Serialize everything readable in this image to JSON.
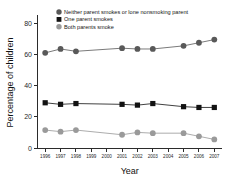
{
  "chart_data": {
    "type": "line",
    "title": "",
    "xlabel": "Year",
    "ylabel": "Percentage of children",
    "categories": [
      "1996",
      "1997",
      "1998",
      "1999",
      "2000",
      "2001",
      "2002",
      "2003",
      "2004",
      "2005",
      "2006",
      "2007"
    ],
    "x": [
      1996,
      1997,
      1998,
      1999,
      2000,
      2001,
      2002,
      2003,
      2004,
      2005,
      2006,
      2007
    ],
    "xlim": [
      1995.5,
      2007.5
    ],
    "ylim": [
      0,
      84
    ],
    "yticks": [
      0,
      20,
      40,
      60,
      80
    ],
    "ytick_labels": [
      "0",
      "20",
      "40",
      "60",
      "80"
    ],
    "xticks": [
      1996,
      1997,
      1998,
      1999,
      2000,
      2001,
      2002,
      2003,
      2004,
      2005,
      2006,
      2007
    ],
    "xtick_labels": [
      "1996",
      "1997",
      "1998",
      "1999",
      "2000",
      "2001",
      "2002",
      "2003",
      "2004",
      "2005",
      "2006",
      "2007"
    ],
    "grid": false,
    "legend_position": "top-center",
    "series": [
      {
        "name": "Neither parent smokes or lone nonsmoking parent",
        "marker": "circle",
        "color": "#595959",
        "line_color": "#6b6b6b",
        "values": [
          61,
          63.5,
          62,
          null,
          null,
          64,
          63.5,
          63.5,
          null,
          65.5,
          67.5,
          69.5
        ]
      },
      {
        "name": "One parent smokes",
        "marker": "square",
        "color": "#121212",
        "line_color": "#2b2b2b",
        "values": [
          29,
          28,
          28.5,
          null,
          null,
          28,
          27.5,
          28.5,
          null,
          26.5,
          26,
          26
        ]
      },
      {
        "name": "Both parents smoke",
        "marker": "circle",
        "color": "#9a9a9a",
        "line_color": "#a3a3a3",
        "values": [
          11.5,
          10.5,
          11.5,
          null,
          null,
          8.5,
          10,
          9.5,
          null,
          9.5,
          7.5,
          5.5
        ]
      }
    ]
  },
  "legend": {
    "items": [
      {
        "label": "Neither parent smokes or lone nonsmoking parent",
        "marker": "circle",
        "color": "#595959"
      },
      {
        "label": "One parent smokes",
        "marker": "square",
        "color": "#121212"
      },
      {
        "label": "Both parents smoke",
        "marker": "circle",
        "color": "#9a9a9a"
      }
    ]
  },
  "axes": {
    "y_title": "Percentage of children",
    "x_title": "Year"
  }
}
